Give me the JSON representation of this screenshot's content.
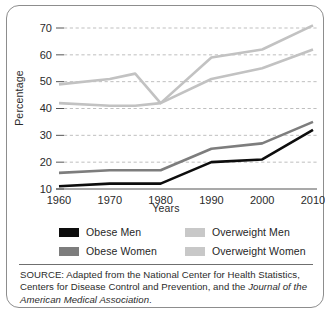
{
  "chart_data": {
    "type": "line",
    "title": "",
    "xlabel": "Years",
    "ylabel": "Percentage",
    "x": [
      1960,
      1970,
      1980,
      1990,
      2000,
      2010
    ],
    "xlim": [
      1960,
      2010
    ],
    "ylim": [
      10,
      70
    ],
    "yticks": [
      10,
      20,
      30,
      40,
      50,
      60,
      70
    ],
    "xticks": [
      "1960",
      "1970",
      "1980",
      "1990",
      "2000",
      "2010"
    ],
    "grid": "horizontal-dashed",
    "legend_position": "below-plot-two-columns",
    "series": [
      {
        "name": "Obese Men",
        "color": "#0d0d0d",
        "x": [
          1960,
          1970,
          1980,
          1990,
          2000,
          2010
        ],
        "values": [
          11,
          12,
          12,
          20,
          21,
          32
        ]
      },
      {
        "name": "Obese Women",
        "color": "#7d7d7d",
        "x": [
          1960,
          1970,
          1980,
          1990,
          2000,
          2010
        ],
        "values": [
          16,
          17,
          17,
          25,
          27,
          35
        ]
      },
      {
        "name": "Overweight Men",
        "color": "#c2c2c2",
        "x": [
          1960,
          1970,
          1975,
          1980,
          1990,
          2000,
          2010
        ],
        "values": [
          49,
          51,
          53,
          42,
          59,
          62,
          71
        ]
      },
      {
        "name": "Overweight Women",
        "color": "#c2c2c2",
        "x": [
          1960,
          1970,
          1975,
          1980,
          1990,
          2000,
          2010
        ],
        "values": [
          42,
          41,
          41,
          42,
          51,
          55,
          62
        ]
      }
    ]
  },
  "axes": {
    "ylabel": "Percentage",
    "xlabel": "Years",
    "ytick_labels": [
      "70",
      "60",
      "50",
      "40",
      "30",
      "20",
      "10"
    ],
    "xtick_labels": [
      "1960",
      "1970",
      "1980",
      "1990",
      "2000",
      "2010"
    ]
  },
  "legend": {
    "left_column": [
      {
        "label": "Obese Men",
        "color": "#0d0d0d"
      },
      {
        "label": "Obese Women",
        "color": "#7d7d7d"
      }
    ],
    "right_column": [
      {
        "label": "Overweight Men",
        "color": "#c8c8c8"
      },
      {
        "label": "Overweight Women",
        "color": "#c8c8c8"
      }
    ]
  },
  "source": {
    "lead": "SOURCE: Adapted from the National Center for Health Statistics, Centers for Disease Control and Prevention, and the ",
    "italic_title": "Journal of the American Medical Association",
    "trailing": "."
  },
  "colors": {
    "obese_men": "#0d0d0d",
    "obese_women": "#7d7d7d",
    "overweight": "#c2c2c2",
    "grid": "#b8b8b8",
    "axis": "#555555",
    "border": "#8d8d8d"
  }
}
